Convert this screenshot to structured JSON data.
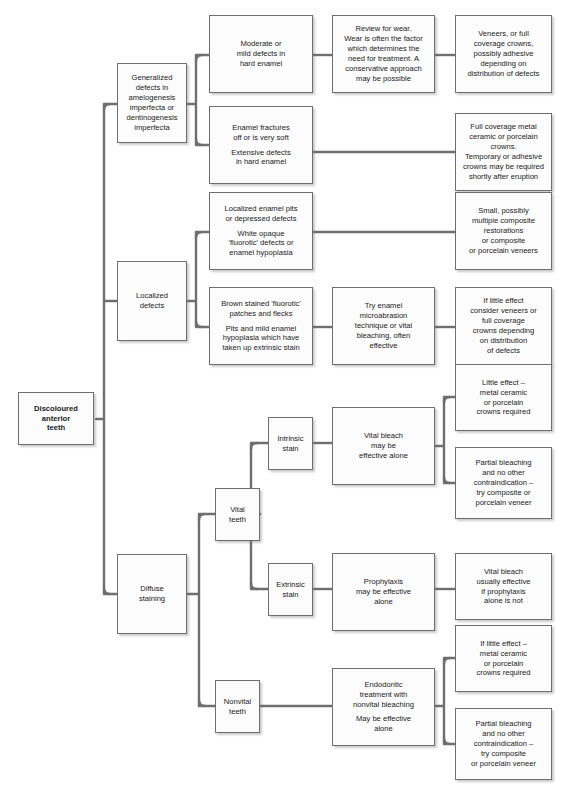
{
  "diagram": {
    "style": {
      "box_fill": "#fcfcfc",
      "box_border": "#6e6e6e",
      "connector": "#6f6f6f",
      "text": "#1a1a1a",
      "background": "#ffffff"
    }
  },
  "nodes": [
    {
      "id": "root",
      "name": "discoloured-anterior-teeth",
      "paragraphs": [
        "Discoloured\nanterior\nteeth"
      ],
      "x": 18,
      "y": 392,
      "w": 76,
      "h": 53,
      "bold": true
    },
    {
      "id": "generalized",
      "name": "generalized-defects",
      "paragraphs": [
        "Generalized\ndefects in\namelogenesis\nimperfecta or\ndentinogenesis\nimperfecta"
      ],
      "x": 117,
      "y": 63,
      "w": 70,
      "h": 80
    },
    {
      "id": "localized",
      "name": "localized-defects",
      "paragraphs": [
        "Localized\ndefects"
      ],
      "x": 117,
      "y": 261,
      "w": 70,
      "h": 80
    },
    {
      "id": "diffuse",
      "name": "diffuse-staining",
      "paragraphs": [
        "Diffuse\nstaining"
      ],
      "x": 117,
      "y": 554,
      "w": 70,
      "h": 80
    },
    {
      "id": "moderate",
      "name": "moderate-mild-defects",
      "paragraphs": [
        "Moderate or\nmild defects in\nhard enamel"
      ],
      "x": 209,
      "y": 15,
      "w": 104,
      "h": 78
    },
    {
      "id": "fractures",
      "name": "enamel-fractures",
      "paragraphs": [
        "Enamel fractures\noff or is very soft",
        "Extensive defects\nin hard enamel"
      ],
      "x": 209,
      "y": 106,
      "w": 104,
      "h": 78
    },
    {
      "id": "review",
      "name": "review-for-wear",
      "paragraphs": [
        "Review for wear.\nWear is often the factor\nwhich determines the\nneed for treatment. A\nconservative approach\nmay be possible"
      ],
      "x": 332,
      "y": 15,
      "w": 103,
      "h": 78
    },
    {
      "id": "veneers",
      "name": "veneers-or-full-coverage-crowns",
      "paragraphs": [
        "Veneers, or full\ncoverage crowns,\npossibly adhesive\ndepending on\ndistribution of defects"
      ],
      "x": 455,
      "y": 15,
      "w": 97,
      "h": 78
    },
    {
      "id": "fullmetal",
      "name": "full-coverage-metal-ceramic",
      "paragraphs": [
        "Full coverage metal\nceramic or porcelain\ncrowns.\nTemporary or adhesive\ncrowns may be required\nshortly after eruption"
      ],
      "x": 455,
      "y": 113,
      "w": 97,
      "h": 78
    },
    {
      "id": "pits",
      "name": "localized-enamel-pits",
      "paragraphs": [
        "Localized enamel pits\nor depressed defects",
        "White opaque\n'fluorotic' defects or\nenamel hypoplasia"
      ],
      "x": 209,
      "y": 192,
      "w": 104,
      "h": 78
    },
    {
      "id": "brown",
      "name": "brown-stained-fluorotic-patches",
      "paragraphs": [
        "Brown stained 'fluorotic'\npatches and flecks",
        "Pits and mild enamel\nhypoplasia which have\ntaken up extrinsic stain"
      ],
      "x": 209,
      "y": 287,
      "w": 104,
      "h": 78
    },
    {
      "id": "small",
      "name": "small-composite-restorations",
      "paragraphs": [
        "Small, possibly\nmultiple composite\nrestorations\nor composite\nor porcelain veneers"
      ],
      "x": 455,
      "y": 192,
      "w": 97,
      "h": 78
    },
    {
      "id": "microabrasion",
      "name": "try-enamel-microabrasion",
      "paragraphs": [
        "Try enamel\nmicroabrasion\ntechnique or vital\nbleaching, often\neffective"
      ],
      "x": 332,
      "y": 287,
      "w": 103,
      "h": 78
    },
    {
      "id": "littleeffect1",
      "name": "if-little-effect-consider-veneers",
      "paragraphs": [
        "If little effect\nconsider veneers or\nfull coverage\ncrowns depending\non distribution\nof defects"
      ],
      "x": 455,
      "y": 287,
      "w": 97,
      "h": 78
    },
    {
      "id": "vital",
      "name": "vital-teeth",
      "paragraphs": [
        "Vital\nteeth"
      ],
      "x": 215,
      "y": 488,
      "w": 45,
      "h": 53
    },
    {
      "id": "nonvital",
      "name": "nonvital-teeth",
      "paragraphs": [
        "Nonvital\nteeth"
      ],
      "x": 215,
      "y": 680,
      "w": 45,
      "h": 53
    },
    {
      "id": "intrinsic",
      "name": "intrinsic-stain",
      "paragraphs": [
        "Intrinsic\nstain"
      ],
      "x": 268,
      "y": 417,
      "w": 45,
      "h": 53
    },
    {
      "id": "extrinsic",
      "name": "extrinsic-stain",
      "paragraphs": [
        "Extrinsic\nstain"
      ],
      "x": 268,
      "y": 563,
      "w": 45,
      "h": 53
    },
    {
      "id": "vitalbleach",
      "name": "vital-bleach-effective-alone",
      "paragraphs": [
        "Vital bleach\nmay be\neffective alone"
      ],
      "x": 332,
      "y": 407,
      "w": 103,
      "h": 78
    },
    {
      "id": "prophylaxis",
      "name": "prophylaxis-effective-alone",
      "paragraphs": [
        "Prophylaxis\nmay be effective\nalone"
      ],
      "x": 332,
      "y": 553,
      "w": 103,
      "h": 78
    },
    {
      "id": "endodontic",
      "name": "endodontic-nonvital-bleaching",
      "paragraphs": [
        "Endodontic\ntreatment with\nnonvital bleaching",
        "May be effective\nalone"
      ],
      "x": 332,
      "y": 668,
      "w": 103,
      "h": 78
    },
    {
      "id": "littleeffect2",
      "name": "little-effect-metal-ceramic",
      "paragraphs": [
        "Little effect –\nmetal ceramic\nor porcelain\ncrowns required"
      ],
      "x": 455,
      "y": 364,
      "w": 97,
      "h": 67
    },
    {
      "id": "partial1",
      "name": "partial-bleaching-no-contraindication",
      "paragraphs": [
        "Partial bleaching\nand no other\ncontraindication –\ntry composite or\nporcelain veneer"
      ],
      "x": 455,
      "y": 447,
      "w": 97,
      "h": 72
    },
    {
      "id": "vitalbleach2",
      "name": "vital-bleach-usually-effective",
      "paragraphs": [
        "Vital bleach\nusually effective\nif prophylaxis\nalone is not"
      ],
      "x": 455,
      "y": 553,
      "w": 97,
      "h": 67
    },
    {
      "id": "littleeffect3",
      "name": "if-little-effect-metal-ceramic",
      "paragraphs": [
        "If little effect –\nmetal ceramic\nor porcelain\ncrowns required"
      ],
      "x": 455,
      "y": 625,
      "w": 97,
      "h": 67
    },
    {
      "id": "partial2",
      "name": "partial-bleaching-no-contraindication-2",
      "paragraphs": [
        "Partial bleaching\nand no other\ncontraindication –\ntry composite\nor porcelain veneer"
      ],
      "x": 455,
      "y": 708,
      "w": 97,
      "h": 72
    }
  ],
  "connectors": [
    {
      "name": "root-to-branches",
      "d": "M 96,419 L 104,419 M 104,104 L 104,594 M 104,104 L 117,104 M 104,301 L 117,301 M 104,594 L 117,594",
      "rounded": true
    },
    {
      "name": "generalized-to-children",
      "d": "M 187,104 L 196,104 M 196,55 L 196,145 M 196,55 L 209,55 M 196,145 L 209,145",
      "rounded": true
    },
    {
      "name": "moderate-to-review",
      "d": "M 313,55 L 332,55",
      "rounded": false
    },
    {
      "name": "review-to-veneers",
      "d": "M 435,55 L 455,55",
      "rounded": false
    },
    {
      "name": "fractures-to-fullmetal",
      "d": "M 313,152 L 455,152",
      "rounded": false
    },
    {
      "name": "localized-to-children",
      "d": "M 187,301 L 196,301 M 196,232 L 196,327 M 196,232 L 209,232 M 196,327 L 209,327",
      "rounded": true
    },
    {
      "name": "pits-to-small",
      "d": "M 313,232 L 455,232",
      "rounded": false
    },
    {
      "name": "brown-to-microabrasion",
      "d": "M 313,327 L 332,327",
      "rounded": false
    },
    {
      "name": "microabrasion-to-littleeffect",
      "d": "M 435,327 L 455,327",
      "rounded": false
    },
    {
      "name": "diffuse-to-vital-nonvital",
      "d": "M 187,594 L 199,594 M 199,514 L 199,706 M 199,514 L 215,514 M 199,706 L 215,706",
      "rounded": true
    },
    {
      "name": "vital-to-stains",
      "d": "M 260,514 L 251,514 M 251,443 L 251,589 M 251,443 L 268,443 M 251,589 L 268,589",
      "rounded": true
    },
    {
      "name": "intrinsic-to-vitalbleach",
      "d": "M 313,443 L 332,443",
      "rounded": false
    },
    {
      "name": "vitalbleach-to-outcomes",
      "d": "M 435,446 L 444,446 M 444,397 L 444,483 M 444,397 L 455,397 M 444,483 L 455,483",
      "rounded": true
    },
    {
      "name": "extrinsic-to-prophylaxis",
      "d": "M 313,589 L 332,589",
      "rounded": false
    },
    {
      "name": "prophylaxis-to-vitalbleach2",
      "d": "M 435,589 L 455,589",
      "rounded": false
    },
    {
      "name": "nonvital-to-endodontic",
      "d": "M 260,706 L 332,706",
      "rounded": false
    },
    {
      "name": "endodontic-to-outcomes",
      "d": "M 435,706 L 444,706 M 444,658 L 444,744 M 444,658 L 455,658 M 444,744 L 455,744",
      "rounded": true
    }
  ]
}
